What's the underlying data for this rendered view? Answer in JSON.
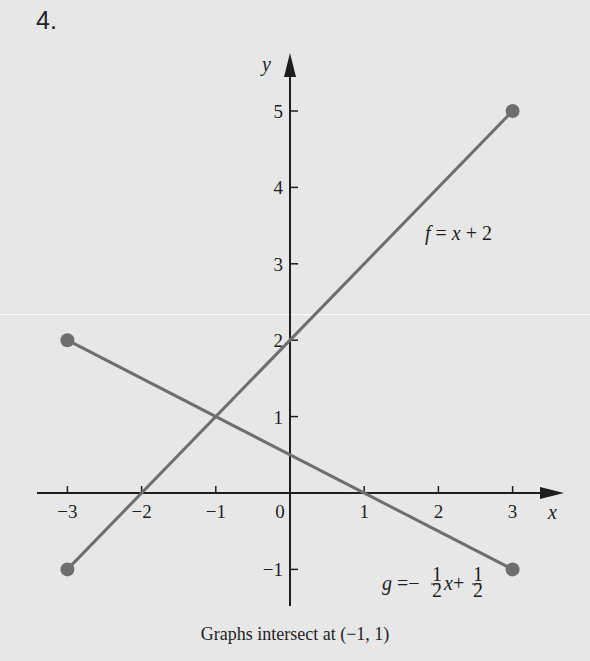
{
  "problem_number": "4.",
  "caption": "Graphs intersect at (−1, 1)",
  "colors": {
    "background": "#e7e7e7",
    "axis": "#1e1e1e",
    "line": "#6e6e6e",
    "point": "#6e6e6e"
  },
  "chart_data": {
    "type": "line",
    "title": "",
    "xlabel": "x",
    "ylabel": "y",
    "xlim": [
      -3.4,
      3.7
    ],
    "ylim": [
      -1.5,
      5.7
    ],
    "grid": false,
    "x_ticks": [
      -3,
      -2,
      -1,
      0,
      1,
      2,
      3
    ],
    "x_tick_labels": [
      "−3",
      "−2",
      "−1",
      "0",
      "1",
      "2",
      "3"
    ],
    "y_ticks": [
      -1,
      1,
      2,
      3,
      4,
      5
    ],
    "y_tick_labels": [
      "−1",
      "1",
      "2",
      "3",
      "4",
      "5"
    ],
    "series": [
      {
        "name": "f",
        "label": "f = x + 2",
        "x": [
          -3,
          3
        ],
        "y": [
          -1,
          5
        ],
        "endpoints_marked": true
      },
      {
        "name": "g",
        "label": "g = −½x + ½",
        "x": [
          -3,
          3
        ],
        "y": [
          2,
          -1
        ],
        "endpoints_marked": true
      }
    ],
    "annotations": [
      {
        "text": "f = x + 2",
        "at": [
          1.9,
          3.3
        ]
      },
      {
        "text": "g = −½x + ½",
        "at": [
          1.3,
          -1.3
        ]
      },
      {
        "text": "Graphs intersect at (−1, 1)",
        "position": "below"
      }
    ],
    "intersection": [
      -1,
      1
    ]
  },
  "labels": {
    "f_name": "f",
    "f_rest": " = x + 2",
    "g_name": "g",
    "g_eq": " =−",
    "g_x": "x",
    "g_plus": " +",
    "half_num": "1",
    "half_den": "2"
  }
}
